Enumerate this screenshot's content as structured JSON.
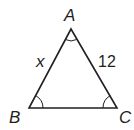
{
  "diagram": {
    "type": "triangle",
    "vertices": [
      {
        "name": "A",
        "x": 71,
        "y": 29
      },
      {
        "name": "B",
        "x": 29,
        "y": 108
      },
      {
        "name": "C",
        "x": 117,
        "y": 108
      }
    ],
    "vertex_labels": {
      "A": "A",
      "B": "B",
      "C": "C"
    },
    "side_labels": {
      "AB": "x",
      "AC": "12"
    },
    "angle_marks": [
      "A",
      "B",
      "C"
    ],
    "stroke_color": "#231f20"
  }
}
